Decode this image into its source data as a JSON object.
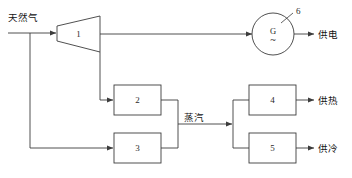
{
  "diagram": {
    "stroke_color": "#3c3c3c",
    "text_color": "#141414",
    "background": "#ffffff",
    "inputs": [
      {
        "id": "natural-gas",
        "label": "天然气"
      }
    ],
    "flow_labels": [
      {
        "id": "steam",
        "label": "蒸汽"
      }
    ],
    "outputs": [
      {
        "id": "power-supply",
        "label": "供电"
      },
      {
        "id": "heat-supply",
        "label": "供热"
      },
      {
        "id": "cooling-supply",
        "label": "供冷"
      }
    ],
    "blocks": [
      {
        "id": "turbine",
        "label": "1",
        "shape": "trapezoid"
      },
      {
        "id": "unit-2",
        "label": "2",
        "shape": "rect"
      },
      {
        "id": "unit-3",
        "label": "3",
        "shape": "rect"
      },
      {
        "id": "unit-4",
        "label": "4",
        "shape": "rect"
      },
      {
        "id": "unit-5",
        "label": "5",
        "shape": "rect"
      }
    ],
    "generator": {
      "id": "generator",
      "symbol": "G",
      "wave": "~",
      "ref": "6"
    }
  }
}
